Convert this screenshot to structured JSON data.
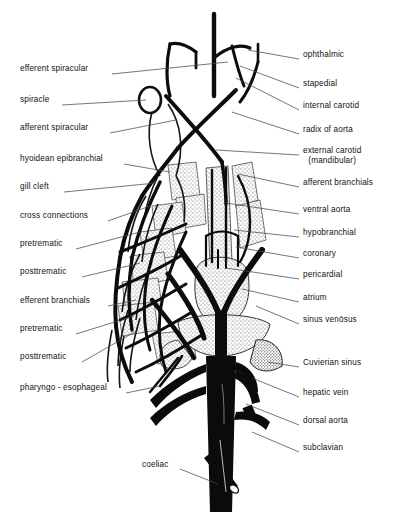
{
  "figure": {
    "background_color": "#ffffff",
    "ink_color": "#111111",
    "leader_color": "#555555"
  },
  "labels_left": [
    {
      "id": "efferent-spiracular",
      "text": "efferent spiracular",
      "x": 10,
      "y": 70,
      "tx": 112,
      "ty": 74,
      "ex": 228,
      "ey": 62
    },
    {
      "id": "spiracle",
      "text": "spiracle",
      "x": 10,
      "y": 101,
      "tx": 62,
      "ty": 105,
      "ex": 146,
      "ey": 100
    },
    {
      "id": "afferent-spiracular",
      "text": "afferent spiracular",
      "x": 10,
      "y": 129,
      "tx": 110,
      "ty": 133,
      "ex": 176,
      "ey": 120
    },
    {
      "id": "hyoidean-epibranchial",
      "text": "hyoidean epibranchial",
      "x": 10,
      "y": 160,
      "tx": 124,
      "ty": 164,
      "ex": 170,
      "ey": 172
    },
    {
      "id": "gill-cleft",
      "text": "gill cleft",
      "x": 10,
      "y": 188,
      "tx": 64,
      "ty": 192,
      "ex": 156,
      "ey": 183
    },
    {
      "id": "cross-connections",
      "text": "cross connections",
      "x": 10,
      "y": 217,
      "tx": 108,
      "ty": 221,
      "ex": 150,
      "ey": 206
    },
    {
      "id": "pretrematic-1",
      "text": "pretrematic",
      "x": 10,
      "y": 245,
      "tx": 76,
      "ty": 249,
      "ex": 140,
      "ey": 232
    },
    {
      "id": "posttrematic-1",
      "text": "posttrematic",
      "x": 10,
      "y": 273,
      "tx": 82,
      "ty": 277,
      "ex": 140,
      "ey": 263
    },
    {
      "id": "efferent-branchials",
      "text": "efferent branchials",
      "x": 10,
      "y": 302,
      "tx": 108,
      "ty": 306,
      "ex": 136,
      "ey": 300
    },
    {
      "id": "pretrematic-2",
      "text": "pretrematic",
      "x": 10,
      "y": 330,
      "tx": 76,
      "ty": 334,
      "ex": 134,
      "ey": 316
    },
    {
      "id": "posttrematic-2",
      "text": "posttrematic",
      "x": 10,
      "y": 358,
      "tx": 82,
      "ty": 362,
      "ex": 138,
      "ey": 330
    },
    {
      "id": "pharyngo-esophageal",
      "text": "pharyngo - esophageal",
      "x": 10,
      "y": 389,
      "tx": 126,
      "ty": 393,
      "ex": 160,
      "ey": 386
    }
  ],
  "labels_right": [
    {
      "id": "ophthalmic",
      "text": "ophthalmic",
      "x": 303,
      "y": 56,
      "tx": 299,
      "ty": 59,
      "ex": 248,
      "ey": 50
    },
    {
      "id": "stapedial",
      "text": "stapedial",
      "x": 303,
      "y": 85,
      "tx": 299,
      "ty": 88,
      "ex": 240,
      "ey": 66
    },
    {
      "id": "internal-carotid",
      "text": "internal carotid",
      "x": 303,
      "y": 107,
      "tx": 299,
      "ty": 110,
      "ex": 236,
      "ey": 78
    },
    {
      "id": "radix-of-aorta",
      "text": "radix of aorta",
      "x": 303,
      "y": 131,
      "tx": 299,
      "ty": 134,
      "ex": 232,
      "ey": 112
    },
    {
      "id": "external-carotid",
      "text": "external carotid",
      "text2": "(mandibular)",
      "x": 303,
      "y": 152,
      "tx": 299,
      "ty": 155,
      "ex": 216,
      "ey": 150
    },
    {
      "id": "afferent-branchials",
      "text": "afferent branchials",
      "x": 303,
      "y": 184,
      "tx": 299,
      "ty": 187,
      "ex": 238,
      "ey": 174
    },
    {
      "id": "ventral-aorta",
      "text": "ventral aorta",
      "x": 303,
      "y": 211,
      "tx": 299,
      "ty": 214,
      "ex": 226,
      "ey": 203
    },
    {
      "id": "hypobranchial",
      "text": "hypobranchial",
      "x": 303,
      "y": 234,
      "tx": 299,
      "ty": 237,
      "ex": 234,
      "ey": 230
    },
    {
      "id": "coronary",
      "text": "coronary",
      "x": 303,
      "y": 255,
      "tx": 299,
      "ty": 258,
      "ex": 236,
      "ey": 247
    },
    {
      "id": "pericardial",
      "text": "pericardial",
      "x": 303,
      "y": 276,
      "tx": 299,
      "ty": 279,
      "ex": 226,
      "ey": 268
    },
    {
      "id": "atrium",
      "text": "atrium",
      "x": 303,
      "y": 299,
      "tx": 299,
      "ty": 302,
      "ex": 242,
      "ey": 289
    },
    {
      "id": "sinus-venosus",
      "text": "sinus venōsus",
      "x": 303,
      "y": 321,
      "tx": 299,
      "ty": 324,
      "ex": 256,
      "ey": 306
    },
    {
      "id": "cuvierian-sinus",
      "text": "Cuvierian sinus",
      "x": 303,
      "y": 364,
      "tx": 299,
      "ty": 367,
      "ex": 268,
      "ey": 362
    },
    {
      "id": "hepatic-vein",
      "text": "hepatic vein",
      "x": 303,
      "y": 394,
      "tx": 299,
      "ty": 397,
      "ex": 252,
      "ey": 378
    },
    {
      "id": "dorsal-aorta",
      "text": "dorsal aorta",
      "x": 303,
      "y": 422,
      "tx": 299,
      "ty": 425,
      "ex": 246,
      "ey": 404
    },
    {
      "id": "subclavian",
      "text": "subclavian",
      "x": 303,
      "y": 449,
      "tx": 299,
      "ty": 452,
      "ex": 252,
      "ey": 432
    }
  ],
  "labels_bottom": [
    {
      "id": "coeliac",
      "text": "coeliac",
      "x": 142,
      "y": 466,
      "tx": 180,
      "ty": 469,
      "ex": 218,
      "ey": 484
    }
  ]
}
